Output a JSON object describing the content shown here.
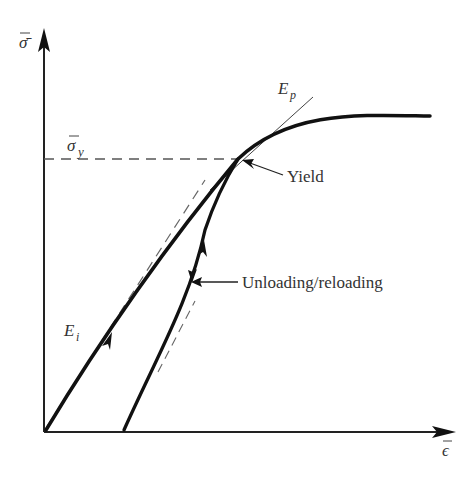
{
  "diagram": {
    "axes": {
      "y_label": "σ̄",
      "x_label": "ϵ̄"
    },
    "labels": {
      "sigma_y": "σ̄",
      "sigma_y_sub": "y",
      "E_p": "E",
      "E_p_sub": "p",
      "E_i": "E",
      "E_i_sub": "i",
      "yield": "Yield",
      "unloading": "Unloading/reloading"
    },
    "colors": {
      "curve": "#111111",
      "axis": "#222222",
      "dashed": "#555555",
      "text": "#333333"
    }
  }
}
